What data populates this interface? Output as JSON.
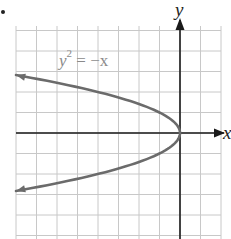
{
  "chart_data": {
    "type": "line",
    "title": "",
    "equation_label": {
      "base": "y",
      "exponent": "2",
      "rest": " = −x"
    },
    "xlabel": "x",
    "ylabel": "y",
    "xlim": [
      -8,
      2
    ],
    "ylim": [
      -5,
      5
    ],
    "grid": true,
    "grid_step": 1,
    "series": [
      {
        "name": "y^2 = -x",
        "relation": "x = -y^2",
        "points": [
          {
            "x": -8,
            "y": 2.83
          },
          {
            "x": -4,
            "y": 2
          },
          {
            "x": -1,
            "y": 1
          },
          {
            "x": 0,
            "y": 0
          },
          {
            "x": -1,
            "y": -1
          },
          {
            "x": -4,
            "y": -2
          },
          {
            "x": -8,
            "y": -2.83
          }
        ],
        "arrows": "both ends",
        "color": "#6b6b6b"
      }
    ],
    "legend": "none"
  },
  "colors": {
    "grid": "#c8c8c8",
    "axis": "#1a1a1a",
    "curve": "#6b6b6b",
    "label": "#8a8a8a"
  }
}
